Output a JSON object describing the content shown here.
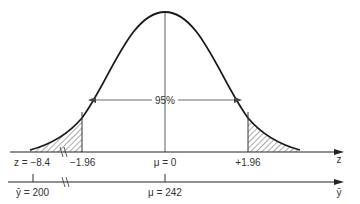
{
  "diagram": {
    "type": "normal-distribution",
    "center_label": "95%",
    "z_axis": {
      "name": "z",
      "ticks": [
        {
          "label": "z = −8.4"
        },
        {
          "label": "−1.96"
        },
        {
          "label": "μ = 0"
        },
        {
          "label": "+1.96"
        }
      ]
    },
    "y_axis": {
      "name": "ȳ",
      "ticks": [
        {
          "label": "ȳ = 200"
        },
        {
          "label": "μ = 242"
        }
      ]
    },
    "colors": {
      "line": "#1a1a1a",
      "hatch": "#444444"
    }
  }
}
